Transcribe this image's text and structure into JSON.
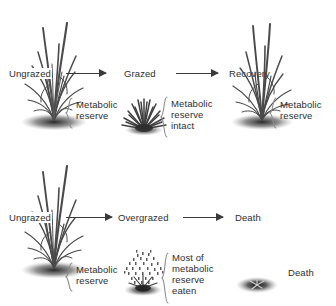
{
  "figure": {
    "background_color": "#ffffff",
    "text_color": "#2e2e2e",
    "arrow_color": "#3a3a3a",
    "brace_color": "#8c8c8c",
    "plant_color": "#4a4a4a"
  },
  "top_row": {
    "stages": [
      {
        "label": "Ungrazed",
        "plant": "tall-grass-tuft-icon"
      },
      {
        "label": "Grazed",
        "plant": "short-grazed-tuft-icon"
      },
      {
        "label": "Recovery",
        "plant": "regrown-grass-tuft-icon"
      }
    ],
    "arrows": [
      {
        "name": "arrow-ungrazed-to-grazed"
      },
      {
        "name": "arrow-grazed-to-recovery"
      }
    ],
    "annotations": [
      {
        "text": "Metabolic\nreserve"
      },
      {
        "text": "Metabolic\nreserve\nintact"
      },
      {
        "text": "Metabolic\nreserve"
      }
    ]
  },
  "bottom_row": {
    "stages": [
      {
        "label": "Ungrazed",
        "plant": "tall-grass-tuft-icon"
      },
      {
        "label": "Overgrazed",
        "plant": "overgrazed-stubble-icon"
      },
      {
        "label": "Death",
        "plant": "dead-plant-icon"
      }
    ],
    "arrows": [
      {
        "name": "arrow-ungrazed-to-overgrazed"
      },
      {
        "name": "arrow-overgrazed-to-death"
      }
    ],
    "annotations": [
      {
        "text": "Metabolic\nreserve"
      },
      {
        "text": "Most of\nmetabolic\nreserve\neaten"
      },
      {
        "text": "Death"
      }
    ]
  }
}
